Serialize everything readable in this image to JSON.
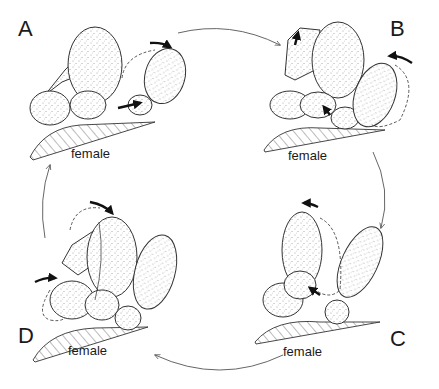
{
  "diagram": {
    "type": "cyclic sequence of four stages",
    "panels": [
      {
        "id": "A",
        "label": "A",
        "substrate_label": "female",
        "position": "top-left"
      },
      {
        "id": "B",
        "label": "B",
        "substrate_label": "female",
        "position": "top-right"
      },
      {
        "id": "C",
        "label": "C",
        "substrate_label": "female",
        "position": "bottom-right"
      },
      {
        "id": "D",
        "label": "D",
        "substrate_label": "female",
        "position": "bottom-left"
      }
    ],
    "cycle_order": [
      "A",
      "B",
      "C",
      "D",
      "A"
    ],
    "cycle_direction": "clockwise",
    "colors": {
      "line": "#333333",
      "stipple": "#555555",
      "background": "#ffffff"
    }
  }
}
